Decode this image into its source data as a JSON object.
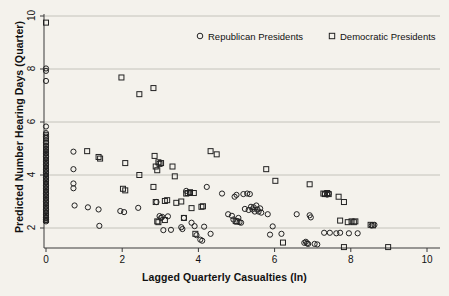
{
  "chart_data": {
    "type": "scatter",
    "title": "",
    "xlabel": "Lagged Quarterly Casualties (ln)",
    "ylabel": "Predicted Number Hearing Days (Quarter)",
    "xlim": [
      0,
      10
    ],
    "ylim": [
      2,
      10
    ],
    "xticks": [
      0,
      2,
      4,
      6,
      8,
      10
    ],
    "yticks": [
      2,
      4,
      6,
      8,
      10
    ],
    "xtick_labels": [
      "0",
      "2",
      "4",
      "6",
      "8",
      "10"
    ],
    "ytick_labels": [
      "2",
      "4",
      "6",
      "8",
      "10"
    ],
    "grid": "horizontal",
    "legend_position": "top-center",
    "background_color": "#f4f2ec",
    "marker_color": "#222222",
    "grid_color": "#b9b7b0",
    "series": [
      {
        "name": "Republican Presidents",
        "marker": "circle",
        "points": [
          [
            0.0,
            8.02
          ],
          [
            0.0,
            7.93
          ],
          [
            0.0,
            7.55
          ],
          [
            0.0,
            5.83
          ],
          [
            0.0,
            5.58
          ],
          [
            0.0,
            5.52
          ],
          [
            0.0,
            5.45
          ],
          [
            0.0,
            5.4
          ],
          [
            0.0,
            5.22
          ],
          [
            0.0,
            5.1
          ],
          [
            0.0,
            4.98
          ],
          [
            0.0,
            4.9
          ],
          [
            0.0,
            4.82
          ],
          [
            0.0,
            4.7
          ],
          [
            0.0,
            4.6
          ],
          [
            0.0,
            4.5
          ],
          [
            0.0,
            4.4
          ],
          [
            0.0,
            4.3
          ],
          [
            0.0,
            4.2
          ],
          [
            0.0,
            4.1
          ],
          [
            0.0,
            4.0
          ],
          [
            0.0,
            3.9
          ],
          [
            0.0,
            3.8
          ],
          [
            0.0,
            3.7
          ],
          [
            0.0,
            3.6
          ],
          [
            0.0,
            3.5
          ],
          [
            0.0,
            3.4
          ],
          [
            0.0,
            3.3
          ],
          [
            0.0,
            3.2
          ],
          [
            0.0,
            3.1
          ],
          [
            0.0,
            3.0
          ],
          [
            0.0,
            2.9
          ],
          [
            0.0,
            2.8
          ],
          [
            0.0,
            2.7
          ],
          [
            0.0,
            2.6
          ],
          [
            0.0,
            2.5
          ],
          [
            0.0,
            2.4
          ],
          [
            0.0,
            2.32
          ],
          [
            0.0,
            2.25
          ],
          [
            0.72,
            4.88
          ],
          [
            0.72,
            4.22
          ],
          [
            0.72,
            3.68
          ],
          [
            0.72,
            3.5
          ],
          [
            0.75,
            2.85
          ],
          [
            1.1,
            2.78
          ],
          [
            1.38,
            2.7
          ],
          [
            1.4,
            2.08
          ],
          [
            1.95,
            2.64
          ],
          [
            2.05,
            2.6
          ],
          [
            2.42,
            2.76
          ],
          [
            2.9,
            2.98
          ],
          [
            2.98,
            2.45
          ],
          [
            3.02,
            2.38
          ],
          [
            3.05,
            2.42
          ],
          [
            3.08,
            1.92
          ],
          [
            3.2,
            2.44
          ],
          [
            3.28,
            1.93
          ],
          [
            3.55,
            2.03
          ],
          [
            3.58,
            1.96
          ],
          [
            3.62,
            2.38
          ],
          [
            3.68,
            3.4
          ],
          [
            3.78,
            3.32
          ],
          [
            3.82,
            2.2
          ],
          [
            3.9,
            2.07
          ],
          [
            3.95,
            1.73
          ],
          [
            4.05,
            1.56
          ],
          [
            4.1,
            1.52
          ],
          [
            4.15,
            2.05
          ],
          [
            4.22,
            3.55
          ],
          [
            4.32,
            1.78
          ],
          [
            4.62,
            3.3
          ],
          [
            4.78,
            2.52
          ],
          [
            4.88,
            2.46
          ],
          [
            4.92,
            2.32
          ],
          [
            4.95,
            3.18
          ],
          [
            5.0,
            3.25
          ],
          [
            5.05,
            2.38
          ],
          [
            5.08,
            2.22
          ],
          [
            5.12,
            2.2
          ],
          [
            5.18,
            3.28
          ],
          [
            5.22,
            2.72
          ],
          [
            5.28,
            3.3
          ],
          [
            5.32,
            2.68
          ],
          [
            5.35,
            3.28
          ],
          [
            5.38,
            2.8
          ],
          [
            5.42,
            2.7
          ],
          [
            5.45,
            2.78
          ],
          [
            5.48,
            2.62
          ],
          [
            5.52,
            2.85
          ],
          [
            5.55,
            2.7
          ],
          [
            5.58,
            2.62
          ],
          [
            5.62,
            2.74
          ],
          [
            5.65,
            2.58
          ],
          [
            5.82,
            2.52
          ],
          [
            5.88,
            1.75
          ],
          [
            5.95,
            2.06
          ],
          [
            6.18,
            1.78
          ],
          [
            6.58,
            2.52
          ],
          [
            6.78,
            1.44
          ],
          [
            6.82,
            1.48
          ],
          [
            6.85,
            1.42
          ],
          [
            6.88,
            1.4
          ],
          [
            6.92,
            2.48
          ],
          [
            6.95,
            2.4
          ],
          [
            7.05,
            1.4
          ],
          [
            7.12,
            1.38
          ],
          [
            7.32,
            3.28
          ],
          [
            7.38,
            3.26
          ],
          [
            7.42,
            3.3
          ],
          [
            7.3,
            1.82
          ],
          [
            7.45,
            1.82
          ],
          [
            7.62,
            1.8
          ],
          [
            7.72,
            1.82
          ],
          [
            7.95,
            1.8
          ],
          [
            8.18,
            1.8
          ],
          [
            8.55,
            2.1
          ],
          [
            8.62,
            2.12
          ]
        ]
      },
      {
        "name": "Democratic Presidents",
        "marker": "square",
        "points": [
          [
            0.0,
            9.75
          ],
          [
            0.0,
            5.3
          ],
          [
            0.0,
            5.18
          ],
          [
            0.0,
            5.05
          ],
          [
            0.0,
            4.95
          ],
          [
            0.0,
            4.85
          ],
          [
            0.0,
            4.75
          ],
          [
            0.0,
            4.65
          ],
          [
            0.0,
            4.55
          ],
          [
            0.0,
            4.45
          ],
          [
            0.0,
            4.35
          ],
          [
            0.0,
            4.25
          ],
          [
            0.0,
            4.15
          ],
          [
            0.0,
            4.05
          ],
          [
            0.0,
            3.95
          ],
          [
            0.0,
            3.85
          ],
          [
            0.0,
            3.75
          ],
          [
            0.0,
            3.65
          ],
          [
            0.0,
            3.55
          ],
          [
            0.0,
            3.45
          ],
          [
            0.0,
            3.35
          ],
          [
            0.0,
            3.25
          ],
          [
            0.0,
            3.15
          ],
          [
            0.0,
            3.05
          ],
          [
            0.0,
            2.95
          ],
          [
            0.0,
            2.85
          ],
          [
            0.0,
            2.75
          ],
          [
            0.0,
            2.65
          ],
          [
            0.0,
            2.55
          ],
          [
            0.0,
            2.45
          ],
          [
            0.0,
            2.38
          ],
          [
            0.0,
            2.3
          ],
          [
            1.08,
            4.9
          ],
          [
            1.38,
            4.68
          ],
          [
            1.42,
            4.62
          ],
          [
            1.98,
            7.68
          ],
          [
            2.45,
            7.05
          ],
          [
            2.82,
            7.28
          ],
          [
            2.02,
            3.48
          ],
          [
            2.08,
            3.42
          ],
          [
            2.08,
            4.45
          ],
          [
            2.45,
            4.0
          ],
          [
            2.82,
            3.55
          ],
          [
            2.85,
            4.72
          ],
          [
            2.88,
            4.32
          ],
          [
            2.92,
            4.18
          ],
          [
            2.95,
            4.48
          ],
          [
            2.98,
            4.42
          ],
          [
            3.02,
            4.45
          ],
          [
            2.88,
            2.98
          ],
          [
            2.92,
            2.25
          ],
          [
            2.95,
            2.22
          ],
          [
            3.12,
            3.02
          ],
          [
            3.18,
            3.05
          ],
          [
            3.12,
            2.3
          ],
          [
            3.32,
            4.32
          ],
          [
            3.38,
            3.95
          ],
          [
            3.42,
            2.95
          ],
          [
            3.55,
            3.0
          ],
          [
            3.62,
            2.38
          ],
          [
            3.68,
            3.3
          ],
          [
            3.72,
            3.32
          ],
          [
            3.78,
            3.35
          ],
          [
            3.82,
            2.75
          ],
          [
            3.88,
            3.32
          ],
          [
            3.92,
            1.78
          ],
          [
            4.08,
            2.8
          ],
          [
            4.12,
            2.82
          ],
          [
            4.32,
            4.9
          ],
          [
            4.48,
            4.78
          ],
          [
            4.98,
            2.26
          ],
          [
            5.02,
            2.24
          ],
          [
            5.78,
            4.22
          ],
          [
            6.02,
            3.78
          ],
          [
            6.22,
            1.45
          ],
          [
            6.92,
            3.65
          ],
          [
            7.28,
            3.3
          ],
          [
            7.32,
            3.28
          ],
          [
            7.38,
            3.32
          ],
          [
            7.42,
            3.28
          ],
          [
            7.68,
            3.18
          ],
          [
            7.82,
            2.98
          ],
          [
            7.72,
            2.28
          ],
          [
            7.92,
            2.22
          ],
          [
            8.02,
            2.25
          ],
          [
            8.08,
            2.22
          ],
          [
            8.12,
            2.25
          ],
          [
            7.82,
            1.28
          ],
          [
            8.52,
            2.12
          ],
          [
            8.58,
            2.1
          ],
          [
            8.98,
            1.28
          ]
        ]
      }
    ]
  },
  "legend": {
    "items": [
      {
        "label": "Republican Presidents",
        "marker": "circle"
      },
      {
        "label": "Democratic Presidents",
        "marker": "square"
      }
    ]
  }
}
